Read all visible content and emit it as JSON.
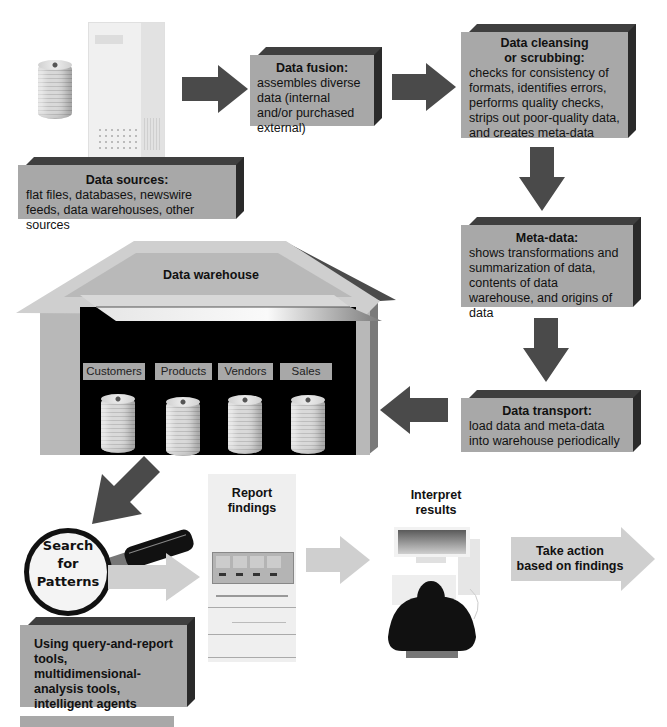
{
  "diagram": {
    "nodes": {
      "data_fusion": {
        "title": "Data fusion:",
        "body": "assembles diverse data (internal and/or purchased external)"
      },
      "data_cleansing": {
        "title_line1": "Data cleansing",
        "title_line2": "or scrubbing:",
        "body": "checks for consistency of formats, identifies errors, performs quality checks, strips out poor-quality data, and creates meta-data"
      },
      "data_sources": {
        "title": "Data sources:",
        "body": "flat files, databases, newswire feeds, data warehouses, other sources"
      },
      "meta_data": {
        "title": "Meta-data:",
        "body": "shows transformations and summarization of data, contents of data warehouse, and origins of data"
      },
      "data_transport": {
        "title": "Data transport:",
        "body": "load data and meta-data into warehouse periodically"
      },
      "data_warehouse": {
        "title": "Data warehouse",
        "bins": [
          "Customers",
          "Products",
          "Vendors",
          "Sales"
        ]
      },
      "search_patterns": {
        "line1": "Search",
        "line2": "for",
        "line3": "Patterns"
      },
      "report_findings": {
        "line1": "Report",
        "line2": "findings"
      },
      "interpret_results": {
        "line1": "Interpret",
        "line2": "results"
      },
      "take_action": {
        "line1": "Take action",
        "line2": "based on findings"
      },
      "tools": {
        "body": "Using query-and-report tools, multidimensional-analysis tools, intelligent agents"
      }
    },
    "colors": {
      "box_fill": "#a8a8a8",
      "box_edge_dark": "#2a2a2a",
      "arrow_dark": "#4a4a4a",
      "arrow_light": "#cfcfcf",
      "warehouse_wall": "#b8b8b8",
      "warehouse_interior": "#000000"
    }
  }
}
